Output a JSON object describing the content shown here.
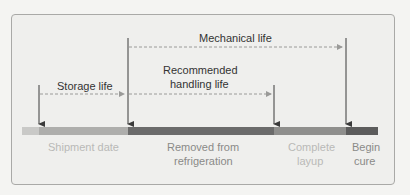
{
  "diagram": {
    "intervals": [
      {
        "label": "Mechanical life",
        "from": "Removed from refrigeration",
        "to": "Begin cure"
      },
      {
        "label": "Recommended handling life",
        "label_lines": [
          "Recommended",
          "handling life"
        ],
        "from": "Removed from refrigeration",
        "to": "Complete layup"
      },
      {
        "label": "Storage life",
        "from": "Shipment date",
        "to": "Removed from refrigeration"
      }
    ],
    "events": [
      {
        "label": "Shipment date",
        "lines": [
          "Shipment date"
        ]
      },
      {
        "label": "Removed from refrigeration",
        "lines": [
          "Removed from",
          "refrigeration"
        ]
      },
      {
        "label": "Complete layup",
        "lines": [
          "Complete",
          "layup"
        ]
      },
      {
        "label": "Begin cure",
        "lines": [
          "Begin",
          "cure"
        ]
      }
    ],
    "colors": {
      "bar_pre": "#c9c9c7",
      "bar_storage": "#aeaeac",
      "bar_handling": "#6b6b6b",
      "bar_layup": "#8f8f8d",
      "bar_cure": "#5c5c5c",
      "arrow": "#3a3a3a",
      "dashed": "#9a9a98"
    }
  }
}
